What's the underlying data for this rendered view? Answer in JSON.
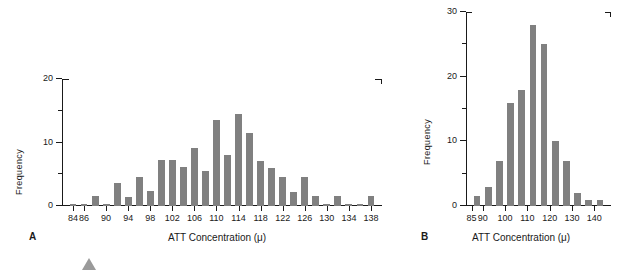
{
  "figure": {
    "bar_color": "#808080",
    "axis_color": "#1a1a1a",
    "marker_color": "#9a9a9a"
  },
  "panels": [
    {
      "letter": "A",
      "ylabel": "Frequency",
      "xlabel": "ATT Concentration (μ)"
    },
    {
      "letter": "B",
      "ylabel": "Frequency",
      "xlabel": "ATT Concentration (μ)"
    }
  ],
  "chart_data": [
    {
      "type": "bar",
      "title": "",
      "panel": "A",
      "xlabel": "ATT Concentration (μ)",
      "ylabel": "Frequency",
      "xlim": [
        82,
        140
      ],
      "ylim": [
        0,
        20
      ],
      "ytick_major": [
        0,
        10,
        20
      ],
      "ytick_major_labels": [
        "0",
        "10",
        "20"
      ],
      "ytick_minor": [
        5,
        15
      ],
      "xtick_major": [
        84,
        86,
        90,
        94,
        98,
        102,
        106,
        110,
        114,
        118,
        122,
        126,
        130,
        134,
        138
      ],
      "xtick_major_labels": [
        "84",
        "86",
        "90",
        "94",
        "98",
        "102",
        "106",
        "110",
        "114",
        "118",
        "122",
        "126",
        "130",
        "134",
        "138"
      ],
      "grid": false,
      "legend": "none",
      "bin_width": 2,
      "categories": [
        84,
        86,
        88,
        90,
        92,
        94,
        96,
        98,
        100,
        102,
        104,
        106,
        108,
        110,
        112,
        114,
        116,
        118,
        120,
        122,
        124,
        126,
        128,
        130,
        132,
        134,
        136,
        138
      ],
      "values": [
        0.3,
        0.3,
        1.5,
        0.3,
        3.6,
        1.4,
        4.5,
        2.3,
        7.2,
        7.2,
        6.2,
        9.2,
        5.5,
        13.5,
        8.1,
        14.5,
        11.5,
        7.1,
        6.0,
        4.5,
        2.2,
        4.5,
        1.5,
        0.3,
        1.5,
        0.3,
        0.3,
        1.5
      ]
    },
    {
      "type": "bar",
      "title": "",
      "panel": "B",
      "xlabel": "ATT Concentration (μ)",
      "ylabel": "Frequency",
      "xlim": [
        82.5,
        147.5
      ],
      "ylim": [
        0,
        30
      ],
      "ytick_major": [
        0,
        10,
        20,
        30
      ],
      "ytick_major_labels": [
        "0",
        "10",
        "20",
        "30"
      ],
      "ytick_minor": [
        5,
        15,
        25
      ],
      "xtick_major": [
        85,
        90,
        100,
        110,
        120,
        130,
        140
      ],
      "xtick_major_labels": [
        "85",
        "90",
        "100",
        "110",
        "120",
        "130",
        "140"
      ],
      "grid": false,
      "legend": "none",
      "bin_width": 5,
      "categories": [
        87.5,
        92.5,
        97.5,
        102.5,
        107.5,
        112.5,
        117.5,
        122.5,
        127.5,
        132.5,
        137.5,
        142.5
      ],
      "values": [
        1.5,
        3.0,
        7.0,
        16.0,
        18.0,
        28.0,
        25.0,
        10.0,
        7.0,
        2.0,
        1.0,
        1.0
      ]
    }
  ]
}
